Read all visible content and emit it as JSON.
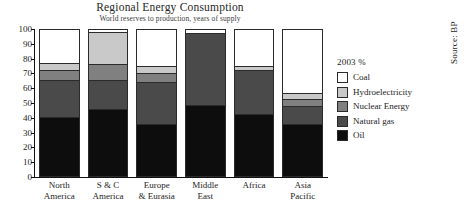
{
  "chart_data": {
    "type": "bar",
    "subtype": "stacked-bar-100",
    "title": "Regional Energy Consumption",
    "subtitle": "World reserves to production, years of supply",
    "xlabel": "",
    "ylabel": "",
    "ylim": [
      0,
      100
    ],
    "yticks": [
      0,
      10,
      20,
      30,
      40,
      50,
      60,
      70,
      80,
      90,
      100
    ],
    "grid": false,
    "legend_position": "right",
    "legend_title": "2003 %",
    "categories": [
      "North America",
      "S & C America",
      "Europe & Eurasia",
      "Middle East",
      "Africa",
      "Asia Pacific"
    ],
    "category_lines": [
      [
        "North",
        "America"
      ],
      [
        "S & C",
        "America"
      ],
      [
        "Europe",
        "& Eurasia"
      ],
      [
        "Middle",
        "East"
      ],
      [
        "Africa",
        ""
      ],
      [
        "Asia",
        "Pacific"
      ]
    ],
    "series": [
      {
        "name": "Oil",
        "color": "#0d0d0d",
        "values": [
          40,
          45,
          35,
          48,
          42,
          35
        ]
      },
      {
        "name": "Natural gas",
        "color": "#4a4a4a",
        "values": [
          25,
          20,
          29,
          49,
          30,
          12
        ]
      },
      {
        "name": "Nuclear Energy",
        "color": "#808080",
        "values": [
          7,
          11,
          6,
          0,
          0,
          5
        ]
      },
      {
        "name": "Hydroelectricity",
        "color": "#c9c9c9",
        "values": [
          5,
          22,
          5,
          0,
          3,
          4
        ]
      },
      {
        "name": "Coal",
        "color": "#ffffff",
        "values": [
          23,
          2,
          25,
          3,
          25,
          44
        ]
      }
    ],
    "legend_entries": [
      {
        "label": "Coal",
        "color": "#ffffff"
      },
      {
        "label": "Hydroelectricity",
        "color": "#c9c9c9"
      },
      {
        "label": "Nuclear Energy",
        "color": "#808080"
      },
      {
        "label": "Natural gas",
        "color": "#4a4a4a"
      },
      {
        "label": "Oil",
        "color": "#0d0d0d"
      }
    ],
    "source": "Source: BP"
  }
}
